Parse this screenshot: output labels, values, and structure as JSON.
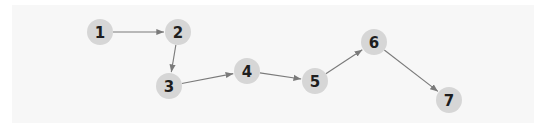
{
  "diagram": {
    "type": "directed-graph",
    "colors": {
      "node_fill": "#d6d6d6",
      "edge": "#7a7a7a",
      "label": "#1e1e1e",
      "background": "#f7f7f7"
    },
    "node_radius": 13,
    "nodes": [
      {
        "id": "1",
        "label": "1",
        "x": 100,
        "y": 32
      },
      {
        "id": "2",
        "label": "2",
        "x": 178,
        "y": 32
      },
      {
        "id": "3",
        "label": "3",
        "x": 169,
        "y": 86
      },
      {
        "id": "4",
        "label": "4",
        "x": 247,
        "y": 71
      },
      {
        "id": "5",
        "label": "5",
        "x": 315,
        "y": 81
      },
      {
        "id": "6",
        "label": "6",
        "x": 374,
        "y": 42
      },
      {
        "id": "7",
        "label": "7",
        "x": 449,
        "y": 100
      }
    ],
    "edges": [
      {
        "from": "1",
        "to": "2"
      },
      {
        "from": "2",
        "to": "3"
      },
      {
        "from": "3",
        "to": "4"
      },
      {
        "from": "4",
        "to": "5"
      },
      {
        "from": "5",
        "to": "6"
      },
      {
        "from": "6",
        "to": "7"
      }
    ]
  }
}
